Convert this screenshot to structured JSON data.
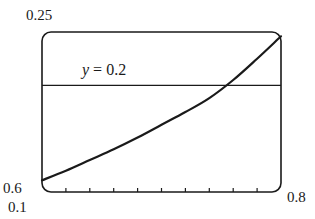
{
  "chart_data": {
    "type": "line",
    "title": "",
    "xlabel": "",
    "ylabel": "",
    "xlim": [
      0.6,
      0.8
    ],
    "ylim": [
      0.1,
      0.25
    ],
    "x_tick_step": 0.02,
    "grid": false,
    "legend": null,
    "corner_labels": {
      "y_max": "0.25",
      "x_min": "0.6",
      "y_min": "0.1",
      "x_max": "0.8"
    },
    "series": [
      {
        "name": "curve",
        "x": [
          0.6,
          0.62,
          0.64,
          0.66,
          0.68,
          0.7,
          0.72,
          0.74,
          0.76,
          0.78,
          0.8
        ],
        "y": [
          0.111,
          0.12,
          0.13,
          0.14,
          0.151,
          0.163,
          0.175,
          0.188,
          0.205,
          0.225,
          0.246
        ]
      },
      {
        "name": "y = 0.2",
        "x": [
          0.6,
          0.8
        ],
        "y": [
          0.2,
          0.2
        ]
      }
    ],
    "annotations": [
      {
        "text": "y = 0.2",
        "x": 0.635,
        "y": 0.212
      }
    ],
    "intersection": {
      "x": 0.741,
      "y": 0.2
    }
  },
  "labels": {
    "y_max": "0.25",
    "x_min": "0.6",
    "y_min": "0.1",
    "x_max": "0.8",
    "line_var": "y",
    "line_eq": " = 0.2"
  },
  "colors": {
    "stroke": "#1a1a1a",
    "background": "#ffffff"
  }
}
